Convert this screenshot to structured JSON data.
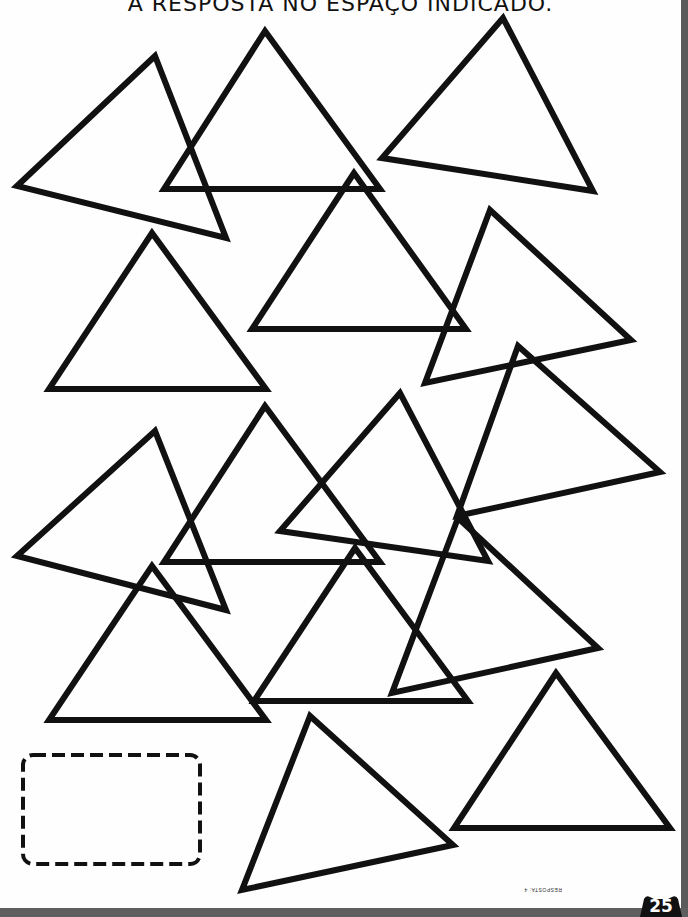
{
  "worksheet": {
    "instruction_fragment": "A RESPOSTA NO ESPAÇO INDICADO.",
    "answer_label": "RESPOSTA: 4",
    "page_number": "25",
    "stroke_color": "#111111",
    "triangles": [
      {
        "id": 1,
        "points": "155,56 17,186 226,238"
      },
      {
        "id": 2,
        "points": "265,31 164,189 380,189"
      },
      {
        "id": 3,
        "points": "503,18 382,158 593,191"
      },
      {
        "id": 4,
        "points": "152,233 49,389 266,389"
      },
      {
        "id": 5,
        "points": "354,173 252,329 466,329"
      },
      {
        "id": 6,
        "points": "490,210 425,383 631,340"
      },
      {
        "id": 7,
        "points": "518,346 457,516 660,472"
      },
      {
        "id": 8,
        "points": "155,431 17,556 226,610"
      },
      {
        "id": 9,
        "points": "265,406 164,562 380,562"
      },
      {
        "id": 10,
        "points": "400,393 280,531 488,561"
      },
      {
        "id": 11,
        "points": "355,548 254,701 468,701"
      },
      {
        "id": 12,
        "points": "458,518 392,693 598,648"
      },
      {
        "id": 13,
        "points": "152,566 49,720 266,720"
      },
      {
        "id": 14,
        "points": "310,716 242,890 453,845"
      },
      {
        "id": 15,
        "points": "556,673 454,828 670,828"
      }
    ]
  }
}
